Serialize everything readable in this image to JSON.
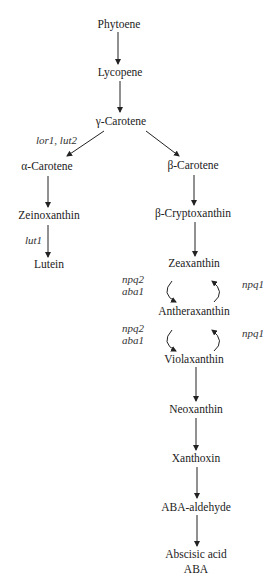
{
  "diagram": {
    "nodes": {
      "phytoene": "Phytoene",
      "lycopene": "Lycopene",
      "gamma_carotene": "γ-Carotene",
      "alpha_carotene": "α-Carotene",
      "beta_carotene": "β-Carotene",
      "zeinoxanthin": "Zeinoxanthin",
      "beta_cryptoxanthin": "β-Cryptoxanthin",
      "lutein": "Lutein",
      "zeaxanthin": "Zeaxanthin",
      "antheraxanthin": "Antheraxanthin",
      "violaxanthin": "Violaxanthin",
      "neoxanthin": "Neoxanthin",
      "xanthoxin": "Xanthoxin",
      "aba_aldehyde": "ABA-aldehyde",
      "abscisic_acid": "Abscisic acid",
      "aba": "ABA"
    },
    "genes": {
      "lor1_lut2": "lor1, lut2",
      "lut1": "lut1",
      "npq2_a": "npq2",
      "aba1_a": "aba1",
      "npq1_a": "npq1",
      "npq2_b": "npq2",
      "aba1_b": "aba1",
      "npq1_b": "npq1"
    },
    "edges": [
      [
        "Phytoene",
        "Lycopene"
      ],
      [
        "Lycopene",
        "γ-Carotene"
      ],
      [
        "γ-Carotene",
        "α-Carotene"
      ],
      [
        "γ-Carotene",
        "β-Carotene"
      ],
      [
        "α-Carotene",
        "Zeinoxanthin"
      ],
      [
        "Zeinoxanthin",
        "Lutein"
      ],
      [
        "β-Carotene",
        "β-Cryptoxanthin"
      ],
      [
        "β-Cryptoxanthin",
        "Zeaxanthin"
      ],
      [
        "Zeaxanthin",
        "Antheraxanthin"
      ],
      [
        "Antheraxanthin",
        "Zeaxanthin"
      ],
      [
        "Antheraxanthin",
        "Violaxanthin"
      ],
      [
        "Violaxanthin",
        "Antheraxanthin"
      ],
      [
        "Violaxanthin",
        "Neoxanthin"
      ],
      [
        "Neoxanthin",
        "Xanthoxin"
      ],
      [
        "Xanthoxin",
        "ABA-aldehyde"
      ],
      [
        "ABA-aldehyde",
        "Abscisic acid"
      ]
    ]
  }
}
